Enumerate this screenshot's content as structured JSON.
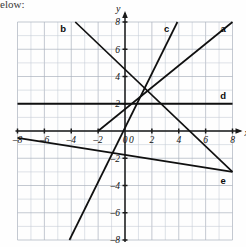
{
  "page": {
    "partial_text_top": "elow:"
  },
  "chart_data": {
    "type": "line",
    "title": "",
    "xlabel": "x",
    "ylabel": "y",
    "xlim": [
      -8,
      8
    ],
    "ylim": [
      -8,
      8
    ],
    "grid": true,
    "grid_step": 1,
    "tick_step": 2,
    "x_ticks": [
      -8,
      -6,
      -4,
      -2,
      0,
      2,
      4,
      6,
      8
    ],
    "x_tick_labels": [
      "-8",
      "-6",
      "-4",
      "-2",
      "0",
      "2",
      "4",
      "6",
      "8"
    ],
    "y_ticks": [
      -8,
      -6,
      -4,
      -2,
      2,
      4,
      6,
      8
    ],
    "y_tick_labels": [
      "-8",
      "-6",
      "-4",
      "-2",
      "2",
      "4",
      "6",
      "8"
    ],
    "origin_label": "0",
    "legend": "inline-end-labels",
    "series": [
      {
        "name": "a",
        "label": "a",
        "slope": 0.8,
        "intercept": 1.6,
        "points": [
          [
            -2,
            0
          ],
          [
            8,
            8
          ]
        ],
        "label_pos": [
          7.3,
          7.5
        ]
      },
      {
        "name": "b",
        "label": "b",
        "slope": -0.9375,
        "intercept": 4.5,
        "points": [
          [
            -3.7,
            8
          ],
          [
            8,
            -3
          ]
        ],
        "label_pos": [
          -4.6,
          7.5
        ]
      },
      {
        "name": "c",
        "label": "c",
        "slope": 2.0,
        "intercept": 0.3,
        "points": [
          [
            -7.9,
            -15.5
          ],
          [
            3.9,
            8
          ]
        ],
        "label_pos": [
          3.1,
          7.5
        ]
      },
      {
        "name": "d",
        "label": "d",
        "slope": 0,
        "intercept": 2,
        "points": [
          [
            -8,
            2
          ],
          [
            8,
            2
          ]
        ],
        "label_pos": [
          7.3,
          2.6
        ]
      },
      {
        "name": "e",
        "label": "e",
        "slope": -0.156,
        "intercept": -1.75,
        "points": [
          [
            -8,
            -0.5
          ],
          [
            8,
            -3
          ]
        ],
        "label_pos": [
          7.3,
          -3.6
        ]
      }
    ],
    "annotations": [
      {
        "text": "a",
        "x": 7.3,
        "y": 7.5
      },
      {
        "text": "b",
        "x": -4.6,
        "y": 7.5
      },
      {
        "text": "c",
        "x": 3.1,
        "y": 7.5
      },
      {
        "text": "d",
        "x": 7.3,
        "y": 2.6
      },
      {
        "text": "e",
        "x": 7.3,
        "y": -3.6
      }
    ],
    "colors": {
      "line": "#101010",
      "axis": "#1a1a1a",
      "grid_minor": "#c3c9d4",
      "grid_major": "#aab1bd",
      "background": "#fefefe"
    }
  }
}
